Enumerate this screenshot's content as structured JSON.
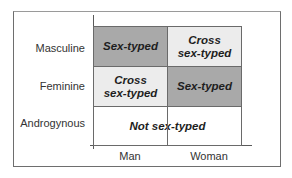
{
  "diagram": {
    "rows": [
      {
        "label": "Masculine"
      },
      {
        "label": "Feminine"
      },
      {
        "label": "Androgynous"
      }
    ],
    "columns": [
      {
        "label": "Man"
      },
      {
        "label": "Woman"
      }
    ],
    "cells": {
      "masculine_man": {
        "line1": "Sex-typed",
        "line2": "",
        "shade": "dark"
      },
      "masculine_woman": {
        "line1": "Cross",
        "line2": "sex-typed",
        "shade": "light"
      },
      "feminine_man": {
        "line1": "Cross",
        "line2": "sex-typed",
        "shade": "light"
      },
      "feminine_woman": {
        "line1": "Sex-typed",
        "line2": "",
        "shade": "dark"
      },
      "androgynous_both": {
        "line1": "Not sex-typed",
        "shade": "white"
      }
    },
    "colors": {
      "dark_fill": "#a9a9a9",
      "light_fill": "#ececec",
      "white_fill": "#ffffff",
      "border": "#6a6a6a",
      "text": "#1e1e1e"
    }
  }
}
